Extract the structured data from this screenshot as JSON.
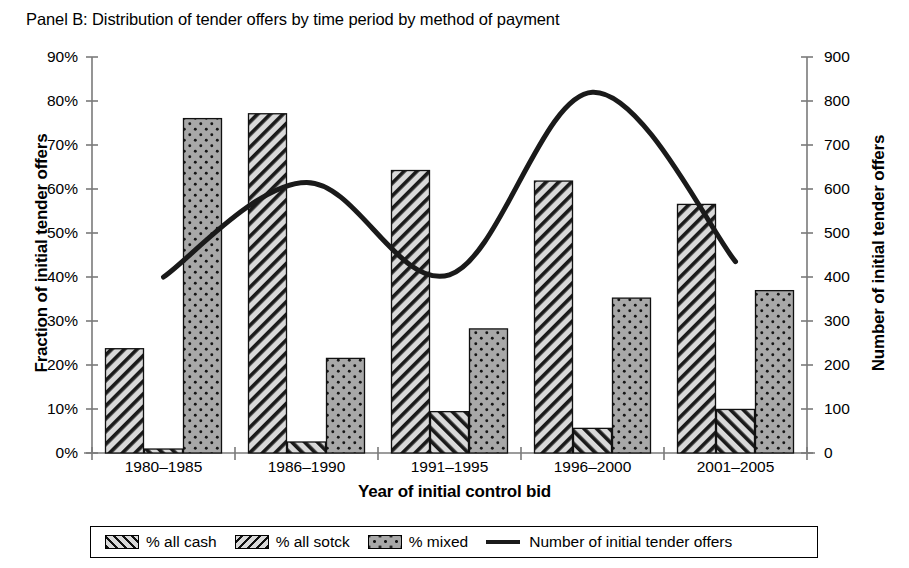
{
  "panel": {
    "title": "Panel B: Distribution of tender offers by time period by method of payment"
  },
  "chart_data": {
    "type": "bar",
    "title": "Panel B: Distribution of tender offers by time period by method of payment",
    "xlabel": "Year of initial control bid",
    "ylabel": "Fraction of initial tender offers",
    "y2label": "Number of initial tender offers",
    "categories": [
      "1980–1985",
      "1986–1990",
      "1991–1995",
      "1996–2000",
      "2001–2005"
    ],
    "ylim": [
      0,
      90
    ],
    "y2lim": [
      0,
      900
    ],
    "yticks": [
      "0%",
      "10%",
      "20%",
      "30%",
      "40%",
      "50%",
      "60%",
      "70%",
      "80%",
      "90%"
    ],
    "ytick_values": [
      0,
      10,
      20,
      30,
      40,
      50,
      60,
      70,
      80,
      90
    ],
    "y2ticks": [
      "0",
      "100",
      "200",
      "300",
      "400",
      "500",
      "600",
      "700",
      "800",
      "900"
    ],
    "y2tick_values": [
      0,
      100,
      200,
      300,
      400,
      500,
      600,
      700,
      800,
      900
    ],
    "grid": false,
    "legend_position": "bottom",
    "series": [
      {
        "name": "% all cash",
        "type": "bar",
        "pattern": "forward-hatch",
        "axis": "left",
        "values": [
          23.7,
          77.1,
          64.2,
          61.8,
          56.5
        ]
      },
      {
        "name": "% all sotck",
        "type": "bar",
        "pattern": "backward-hatch",
        "axis": "left",
        "values": [
          0.9,
          2.5,
          9.4,
          5.6,
          9.9
        ]
      },
      {
        "name": "% mixed",
        "type": "bar",
        "pattern": "dotted",
        "axis": "left",
        "values": [
          76.0,
          21.5,
          28.2,
          35.2,
          36.9
        ]
      },
      {
        "name": "Number of initial tender offers",
        "type": "line",
        "axis": "right",
        "values": [
          400,
          615,
          405,
          820,
          435
        ]
      }
    ]
  },
  "axes": {
    "left_title": "Fraction of initial tender offers",
    "right_title": "Number of initial tender offers",
    "x_title": "Year of initial control bid"
  },
  "legend": {
    "items": [
      {
        "label": "% all cash",
        "swatch": "forward-hatch-swatch"
      },
      {
        "label": "% all sotck",
        "swatch": "backward-hatch-swatch"
      },
      {
        "label": "% mixed",
        "swatch": "dotted-swatch"
      },
      {
        "label": "Number of initial tender offers",
        "swatch": "line-swatch"
      }
    ]
  },
  "colors": {
    "line": "#1a1a1a",
    "bar_dark": "#58585a",
    "bar_gray": "#a8a8a8",
    "axis": "#7a7a7a",
    "text": "#000000"
  }
}
